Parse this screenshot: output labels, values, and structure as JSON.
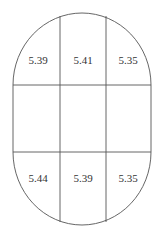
{
  "diagram": {
    "shape": "stadium",
    "grid": {
      "rows": 3,
      "cols": 3
    },
    "cells": [
      [
        "5.39",
        "5.41",
        "5.35"
      ],
      [
        "",
        "",
        ""
      ],
      [
        "5.44",
        "5.39",
        "5.35"
      ]
    ],
    "colors": {
      "stroke": "#555555",
      "text": "#333333",
      "background": "#ffffff"
    }
  }
}
